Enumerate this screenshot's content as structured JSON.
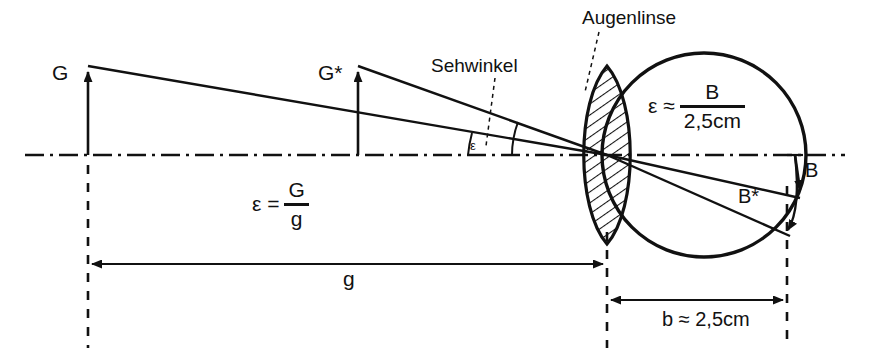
{
  "figure": {
    "labels": {
      "object_G": "G",
      "object_G_star": "G*",
      "visual_angle_name": "Sehwinkel",
      "eye_lens_name": "Augenlinse",
      "angle_symbol": "ε",
      "image_B": "B",
      "image_B_star": "B*",
      "object_distance": "g",
      "image_distance": "b ≈ 2,5cm"
    },
    "formula_angle_object": {
      "lead": "ε =",
      "numerator": "G",
      "denominator": "g"
    },
    "formula_angle_image": {
      "lead": "ε ≈",
      "numerator": "B",
      "denominator": "2,5cm"
    },
    "colors": {
      "ink": "#111111",
      "background": "#ffffff"
    }
  }
}
